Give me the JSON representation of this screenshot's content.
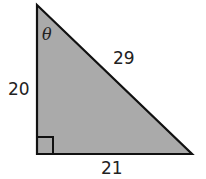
{
  "figure": {
    "type": "right-triangle",
    "fill_color": "#aaaaaa",
    "stroke_color": "#111111",
    "angle_label": "θ",
    "hypotenuse_label": "29",
    "vertical_leg_label": "20",
    "horizontal_leg_label": "21",
    "right_angle_marker": true
  }
}
